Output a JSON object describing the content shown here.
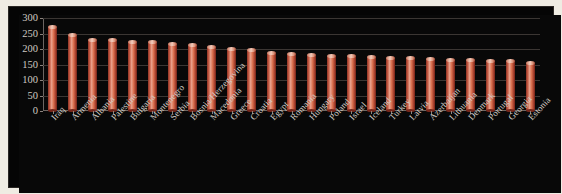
{
  "chart_data": {
    "type": "bar",
    "title": "",
    "xlabel": "",
    "ylabel": "",
    "ylim": [
      0,
      300
    ],
    "yticks": [
      0,
      50,
      100,
      150,
      200,
      250,
      300
    ],
    "ytick_labels": [
      "0",
      "50",
      "100",
      "150",
      "200",
      "250",
      "300"
    ],
    "grid": true,
    "legend": false,
    "bar_color": "#c35a42",
    "background_color": "#080808",
    "text_color": "#d2ccc5",
    "categories": [
      "Iraq",
      "Armenia",
      "Albania",
      "Palestine",
      "Bulgaria",
      "Montenegro",
      "Serbia",
      "Bosnia/Herzegovina",
      "Macedonia",
      "Greece",
      "Croatia",
      "Egypt",
      "Romania",
      "Hungary",
      "Poland",
      "Israel",
      "Iceland",
      "Turkey",
      "Latvia",
      "Azerbaijan",
      "Lithuania",
      "Denmark",
      "Portugal",
      "Georgia",
      "Estonia"
    ],
    "values": [
      270,
      245,
      228,
      228,
      222,
      222,
      216,
      214,
      208,
      200,
      196,
      188,
      184,
      180,
      178,
      176,
      174,
      172,
      170,
      168,
      166,
      164,
      162,
      160,
      156
    ]
  }
}
